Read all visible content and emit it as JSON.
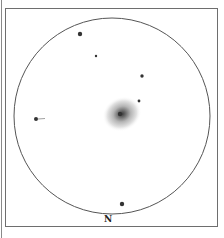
{
  "sketch": {
    "orientation_label": "N",
    "field_circle": {
      "cx": 112,
      "cy": 116,
      "r": 98,
      "stroke": "#555555"
    },
    "galaxy": {
      "cx": 122,
      "cy": 114,
      "rx": 20,
      "ry": 17,
      "core_color": "#333333"
    },
    "stars": [
      {
        "x": 80,
        "y": 34,
        "r": 2.2
      },
      {
        "x": 96,
        "y": 56,
        "r": 1.2
      },
      {
        "x": 142,
        "y": 76,
        "r": 1.7
      },
      {
        "x": 139,
        "y": 101,
        "r": 1.4
      },
      {
        "x": 122,
        "y": 204,
        "r": 2.2
      },
      {
        "x": 36,
        "y": 119,
        "r": 2.0
      }
    ]
  }
}
